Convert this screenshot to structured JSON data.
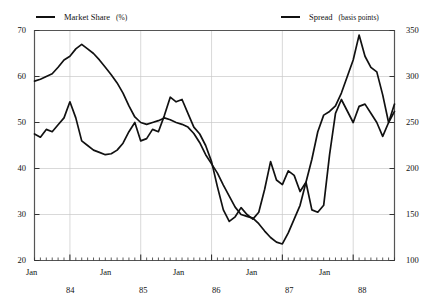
{
  "title": "",
  "legend": {
    "market": {
      "label": "Market Share",
      "unit": "(%)"
    },
    "spread": {
      "label": "Spread",
      "unit": "(basis points)"
    }
  },
  "axes": {
    "left_ticks": [
      "70",
      "60",
      "50",
      "40",
      "30",
      "20"
    ],
    "right_ticks": [
      "350",
      "300",
      "250",
      "200",
      "150",
      "100"
    ],
    "month_labels": [
      "Jan",
      "Jan",
      "Jan",
      "Jan",
      "Jan"
    ],
    "year_labels": [
      "84",
      "85",
      "86",
      "87",
      "88"
    ]
  },
  "colors": {
    "line": "#111111",
    "grid": "#c9c9c9",
    "axis": "#555555",
    "background": "#ffffff"
  },
  "chart_data": {
    "type": "line",
    "title": "",
    "xlabel": "",
    "ylabel": "Market Share (%)",
    "y2label": "Spread (basis points)",
    "ylim": [
      20,
      70
    ],
    "y2lim": [
      100,
      350
    ],
    "grid": true,
    "legend_position": "top",
    "x": [
      "1983-07",
      "1983-08",
      "1983-09",
      "1983-10",
      "1983-11",
      "1983-12",
      "1984-01",
      "1984-02",
      "1984-03",
      "1984-04",
      "1984-05",
      "1984-06",
      "1984-07",
      "1984-08",
      "1984-09",
      "1984-10",
      "1984-11",
      "1984-12",
      "1985-01",
      "1985-02",
      "1985-03",
      "1985-04",
      "1985-05",
      "1985-06",
      "1985-07",
      "1985-08",
      "1985-09",
      "1985-10",
      "1985-11",
      "1985-12",
      "1986-01",
      "1986-02",
      "1986-03",
      "1986-04",
      "1986-05",
      "1986-06",
      "1986-07",
      "1986-08",
      "1986-09",
      "1986-10",
      "1986-11",
      "1986-12",
      "1987-01",
      "1987-02",
      "1987-03",
      "1987-04",
      "1987-05",
      "1987-06",
      "1987-07",
      "1987-08",
      "1987-09",
      "1987-10",
      "1987-11",
      "1987-12",
      "1988-01",
      "1988-02",
      "1988-03",
      "1988-04",
      "1988-05",
      "1988-06",
      "1988-07",
      "1988-08"
    ],
    "x_tick_positions": [
      "1984-01",
      "1985-01",
      "1986-01",
      "1987-01",
      "1988-01"
    ],
    "series": [
      {
        "name": "Market Share",
        "axis": "left",
        "unit": "%",
        "values": [
          47.5,
          46.8,
          48.5,
          48.0,
          49.5,
          51.0,
          54.5,
          51.0,
          46.0,
          45.0,
          44.0,
          43.5,
          43.0,
          43.2,
          44.0,
          45.5,
          48.0,
          50.0,
          46.0,
          46.5,
          48.5,
          48.0,
          51.5,
          55.5,
          54.5,
          55.0,
          52.0,
          49.0,
          47.5,
          45.0,
          41.5,
          36.0,
          31.0,
          28.5,
          29.5,
          31.5,
          30.0,
          29.0,
          30.5,
          35.5,
          41.5,
          37.5,
          36.5,
          39.5,
          38.5,
          35.0,
          37.0,
          31.0,
          30.5,
          32.0,
          43.0,
          52.0,
          55.0,
          52.5,
          50.0,
          53.5,
          54.0,
          52.0,
          50.0,
          47.0,
          50.0,
          54.0
        ]
      },
      {
        "name": "Spread",
        "axis": "right",
        "unit": "basis points",
        "values": [
          295,
          297,
          300,
          303,
          310,
          318,
          322,
          330,
          335,
          330,
          325,
          318,
          310,
          302,
          293,
          282,
          268,
          256,
          250,
          248,
          250,
          252,
          255,
          253,
          250,
          248,
          245,
          238,
          228,
          215,
          205,
          195,
          182,
          170,
          158,
          150,
          148,
          146,
          140,
          132,
          125,
          120,
          118,
          130,
          145,
          160,
          185,
          210,
          240,
          258,
          262,
          268,
          282,
          300,
          318,
          345,
          322,
          310,
          305,
          280,
          250,
          262
        ]
      }
    ]
  }
}
